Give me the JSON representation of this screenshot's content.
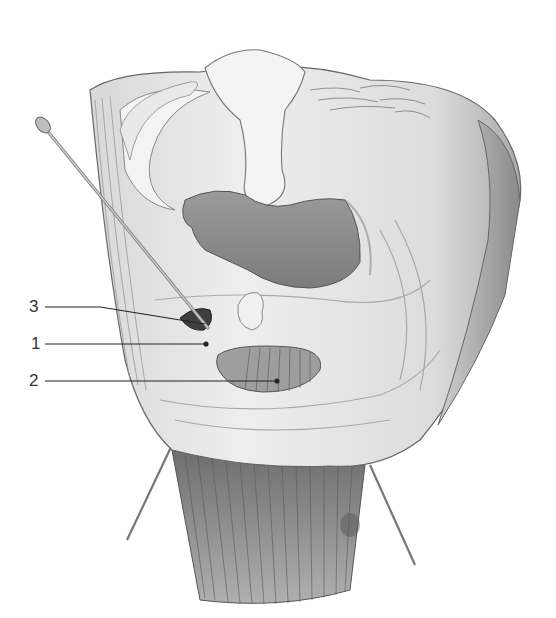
{
  "figure": {
    "colors": {
      "background": "#ffffff",
      "tissue_light": "#e6e6e6",
      "tissue_mid": "#bdbdbd",
      "tissue_dark": "#7a7a7a",
      "cavity": "#8c8c8c",
      "outline": "#555555",
      "label_line": "#222222"
    },
    "labels": [
      {
        "id": "3",
        "text": "3",
        "y": 307,
        "target_x": 205,
        "target_y": 324
      },
      {
        "id": "1",
        "text": "1",
        "y": 344,
        "target_x": 206,
        "target_y": 344
      },
      {
        "id": "2",
        "text": "2",
        "y": 381,
        "target_x": 277,
        "target_y": 381
      }
    ]
  }
}
